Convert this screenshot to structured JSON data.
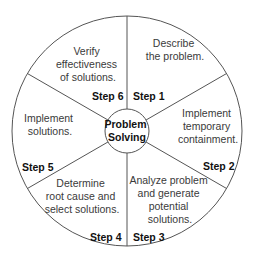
{
  "center": {
    "lines": [
      "Problem",
      "Solving"
    ]
  },
  "steps": [
    {
      "label": "Step 1",
      "desc": [
        "Describe",
        "the problem."
      ]
    },
    {
      "label": "Step 2",
      "desc": [
        "Implement",
        "temporary",
        "containment."
      ]
    },
    {
      "label": "Step 3",
      "desc": [
        "Analyze problem",
        "and generate",
        "potential",
        "solutions."
      ]
    },
    {
      "label": "Step 4",
      "desc": [
        "Determine",
        "root cause and",
        "select solutions."
      ]
    },
    {
      "label": "Step 5",
      "desc": [
        "Implement",
        "solutions."
      ]
    },
    {
      "label": "Step 6",
      "desc": [
        "Verify",
        "effectiveness",
        "of solutions."
      ]
    }
  ],
  "colors": {
    "line": "#555555",
    "text": "#3a3a3a",
    "step": "#111111"
  }
}
